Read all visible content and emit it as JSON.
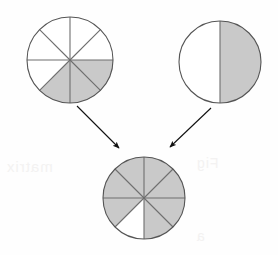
{
  "figure": {
    "background_color": "#fefefe",
    "shade_color": "#c9c9c9",
    "outline_color": "#555555",
    "divider_color": "#6e6e6e",
    "arrow_color": "#111111"
  },
  "pies": [
    {
      "id": "addend-left",
      "name": "top-left-pie",
      "label": "3/8",
      "numerator": 3,
      "denominator": 8,
      "sectors": 8,
      "shaded_sectors": 3,
      "shaded_indices": [
        2,
        3,
        4
      ],
      "center_x": 70,
      "center_y": 60,
      "radius": 43
    },
    {
      "id": "addend-right",
      "name": "top-right-pie",
      "label": "1/2",
      "numerator": 1,
      "denominator": 2,
      "sectors": 2,
      "shaded_sectors": 1,
      "shaded_indices": [
        0
      ],
      "center_x": 220,
      "center_y": 62,
      "radius": 41
    },
    {
      "id": "sum",
      "name": "bottom-pie",
      "label": "7/8",
      "numerator": 7,
      "denominator": 8,
      "sectors": 8,
      "shaded_sectors": 7,
      "shaded_indices": [
        0,
        1,
        2,
        3,
        6,
        7,
        5
      ],
      "white_indices": [
        4
      ],
      "center_x": 144,
      "center_y": 198,
      "radius": 41
    }
  ],
  "arrows": [
    {
      "id": "arrow-left",
      "name": "arrow-from-left-pie",
      "from_x": 77,
      "from_y": 106,
      "to_x": 119,
      "to_y": 148
    },
    {
      "id": "arrow-right",
      "name": "arrow-from-right-pie",
      "from_x": 211,
      "from_y": 108,
      "to_x": 170,
      "to_y": 147
    }
  ],
  "chart_data": {
    "type": "pie",
    "equation": "3/8 + 1/2 = 7/8",
    "charts": [
      {
        "name": "top-left-pie",
        "role": "first addend",
        "categories": [
          "shaded",
          "unshaded"
        ],
        "values": [
          3,
          5
        ],
        "fraction": "3/8",
        "slices": 8
      },
      {
        "name": "top-right-pie",
        "role": "second addend",
        "categories": [
          "shaded",
          "unshaded"
        ],
        "values": [
          1,
          1
        ],
        "fraction": "1/2",
        "slices": 2
      },
      {
        "name": "bottom-pie",
        "role": "sum",
        "categories": [
          "shaded",
          "unshaded"
        ],
        "values": [
          7,
          1
        ],
        "fraction": "7/8",
        "slices": 8
      }
    ],
    "legend": [],
    "grid": false
  },
  "ghost_text": {
    "left": "matrix",
    "right": "Fig",
    "low": "a"
  }
}
